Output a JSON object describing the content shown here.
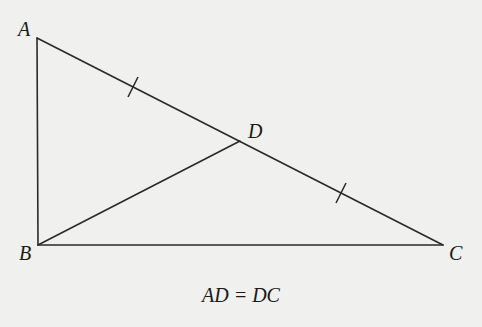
{
  "diagram": {
    "type": "geometry-triangle",
    "points": {
      "A": {
        "label": "A",
        "x": 37,
        "y": 38
      },
      "B": {
        "label": "B",
        "x": 38,
        "y": 245
      },
      "C": {
        "label": "C",
        "x": 443,
        "y": 245
      },
      "D": {
        "label": "D",
        "x": 240,
        "y": 141
      }
    },
    "segments": [
      "AB",
      "BC",
      "AC",
      "BD"
    ],
    "tick_marks": [
      {
        "segment": "AD",
        "count": 1
      },
      {
        "segment": "DC",
        "count": 1
      }
    ],
    "right_angle_at": "B",
    "caption": "AD = DC"
  }
}
